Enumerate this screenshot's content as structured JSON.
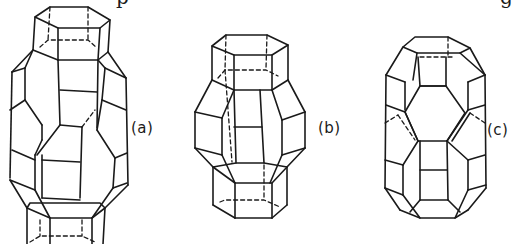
{
  "figure": {
    "panels": [
      {
        "id": "a",
        "label": "(a)"
      },
      {
        "id": "b",
        "label": "(b)"
      },
      {
        "id": "c",
        "label": "(c)"
      }
    ],
    "top_text_fragments": [
      "p",
      "g"
    ],
    "colors": {
      "line": "#1a1a1a",
      "background": "#ffffff"
    }
  }
}
